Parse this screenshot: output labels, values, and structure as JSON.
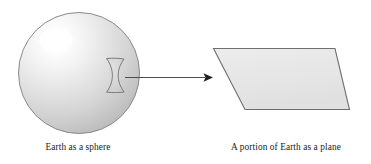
{
  "figure": {
    "background_color": "#ffffff",
    "width": 371,
    "height": 164
  },
  "sphere": {
    "label": "Earth as a sphere",
    "center_x": 79,
    "center_y": 73,
    "radius": 61,
    "outline_color": "#8a8a8a",
    "highlight_color": "#ffffff",
    "midtone_color": "#dcdcdc",
    "shadow_color": "#b2b2b2"
  },
  "patch": {
    "name": "curved surface patch",
    "outline_color": "#7a7a7a",
    "fill_color": "#d2d2d2"
  },
  "arrow": {
    "name": "transformation arrow",
    "color": "#4d4d4d",
    "start_x": 126,
    "start_y": 77,
    "end_x": 213,
    "end_y": 77
  },
  "plane": {
    "label": "A portion of Earth as a plane",
    "fill_color": "#e8e8e8",
    "outline_color": "#6f6f6f",
    "corners": [
      {
        "x": 213,
        "y": 48
      },
      {
        "x": 335,
        "y": 48
      },
      {
        "x": 350,
        "y": 110
      },
      {
        "x": 245,
        "y": 110
      }
    ]
  },
  "captions": {
    "left": "Earth as a sphere",
    "right": "A portion of Earth as a plane",
    "left_x": 78,
    "right_x": 286,
    "baseline_y": 150
  }
}
